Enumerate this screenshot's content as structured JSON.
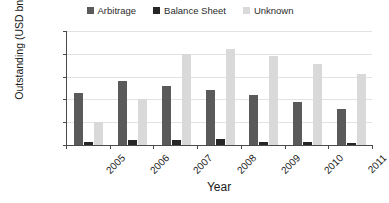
{
  "chart_data": {
    "type": "bar",
    "title": "",
    "xlabel": "Year",
    "ylabel": "Outstanding (USD bn)",
    "categories": [
      "2005",
      "2006",
      "2007",
      "2008",
      "2009",
      "2010",
      "2011"
    ],
    "ylim": [
      0,
      1000
    ],
    "yticks": [
      0,
      200,
      400,
      600,
      800,
      1000
    ],
    "grid": true,
    "legend_position": "top-center",
    "series": [
      {
        "name": "Arbitrage",
        "color": "#5a5a5a",
        "values": [
          455,
          560,
          515,
          485,
          440,
          375,
          320
        ]
      },
      {
        "name": "Balance Sheet",
        "color": "#262626",
        "values": [
          25,
          40,
          45,
          50,
          30,
          25,
          15
        ]
      },
      {
        "name": "Unknown",
        "color": "#d9d9d9",
        "values": [
          200,
          400,
          800,
          840,
          780,
          710,
          620
        ]
      }
    ]
  }
}
